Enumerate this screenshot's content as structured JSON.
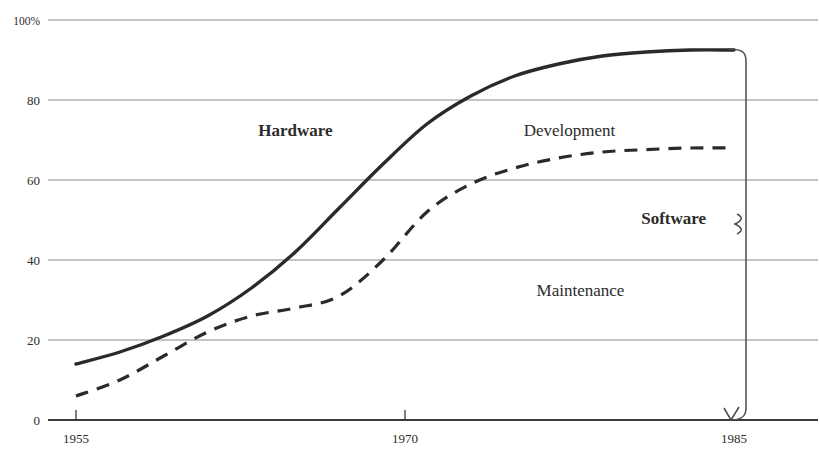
{
  "chart_data": {
    "type": "line",
    "title": "",
    "subtitle": "",
    "xlabel": "",
    "ylabel": "",
    "xlim": [
      1955,
      1985
    ],
    "ylim": [
      0,
      100
    ],
    "grid": true,
    "legend_position": "inline-annotations",
    "x_ticks": [
      "1955",
      "1970",
      "1985"
    ],
    "x_tick_values": [
      1955,
      1970,
      1985
    ],
    "y_ticks": [
      "0",
      "20",
      "40",
      "60",
      "80",
      "100%"
    ],
    "y_tick_values": [
      0,
      20,
      40,
      60,
      80,
      100
    ],
    "series": [
      {
        "name": "Hardware / Software boundary",
        "style": "solid",
        "color": "#2a2a2a",
        "x": [
          1955,
          1957,
          1959,
          1961,
          1963,
          1965,
          1967,
          1969,
          1971,
          1973,
          1975,
          1977,
          1979,
          1981,
          1983,
          1985
        ],
        "values": [
          14,
          17,
          21,
          26,
          33,
          42,
          53,
          64,
          74,
          81,
          86,
          89,
          91,
          92,
          92.5,
          92.5
        ]
      },
      {
        "name": "Development / Maintenance boundary",
        "style": "dashed",
        "color": "#2a2a2a",
        "x": [
          1955,
          1957,
          1959,
          1961,
          1963,
          1965,
          1967,
          1969,
          1971,
          1973,
          1975,
          1977,
          1979,
          1981,
          1983,
          1985
        ],
        "values": [
          6,
          10,
          16,
          22,
          26,
          28,
          31,
          40,
          52,
          59,
          63,
          65.5,
          67,
          67.6,
          68,
          68
        ]
      }
    ],
    "annotations": [
      {
        "text": "Hardware",
        "x": 1965,
        "y": 71,
        "bold": true,
        "region": "below-solid-left"
      },
      {
        "text": "Development",
        "x": 1977.5,
        "y": 71,
        "bold": false,
        "region": "between-curves"
      },
      {
        "text": "Maintenance",
        "x": 1978,
        "y": 31,
        "bold": false,
        "region": "below-dashed"
      },
      {
        "text": "Software",
        "x": 1984,
        "y": 49,
        "bold": true,
        "region": "brace-label"
      }
    ],
    "brace": {
      "label": "Software",
      "from_percent": 92.5,
      "to_percent": 0,
      "at_year": 1985
    }
  },
  "axes": {
    "y_labels": [
      "100%",
      "80",
      "60",
      "40",
      "20",
      "0"
    ],
    "x_labels": [
      "1955",
      "1970",
      "1985"
    ]
  },
  "labels": {
    "hardware": "Hardware",
    "development": "Development",
    "maintenance": "Maintenance",
    "software": "Software"
  },
  "colors": {
    "curve": "#2a2a2a",
    "gridline": "#8a8a8a",
    "axis": "#3a3a3a",
    "text": "#2b2b2b",
    "background": "#ffffff"
  }
}
